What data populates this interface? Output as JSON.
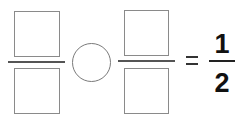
{
  "equation": {
    "left_fraction": {
      "numerator": "",
      "denominator": ""
    },
    "operator": "",
    "right_fraction": {
      "numerator": "",
      "denominator": ""
    },
    "equals": "=",
    "result": {
      "numerator": "1",
      "denominator": "2"
    }
  },
  "colors": {
    "box_border": "#8a8a8a",
    "bar": "#555555",
    "text": "#111111"
  }
}
